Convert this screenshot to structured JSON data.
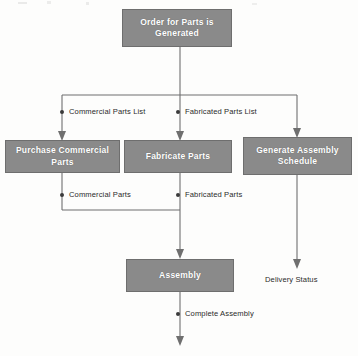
{
  "diagram": {
    "type": "flowchart",
    "box_fill_color": "#8a8a8a",
    "box_text_color": "#ffffff",
    "connector_color": "#6f6f6f",
    "background_color": "#fdfdfc",
    "nodes": [
      {
        "id": "order",
        "label": "Order for Parts is Generated",
        "x": 122,
        "y": 9,
        "w": 110,
        "h": 38
      },
      {
        "id": "purchase",
        "label": "Purchase Commercial Parts",
        "x": 5,
        "y": 140,
        "w": 115,
        "h": 33
      },
      {
        "id": "fabricate",
        "label": "Fabricate Parts",
        "x": 124,
        "y": 140,
        "w": 108,
        "h": 33
      },
      {
        "id": "schedule",
        "label": "Generate Assembly Schedule",
        "x": 243,
        "y": 137,
        "w": 109,
        "h": 38
      },
      {
        "id": "assembly",
        "label": "Assembly",
        "x": 126,
        "y": 259,
        "w": 108,
        "h": 33
      }
    ],
    "flow_labels": [
      {
        "id": "commercial-parts-list",
        "label": "Commercial Parts List",
        "dot_x": 62,
        "dot_y": 112,
        "text_x": 69,
        "text_y": 108
      },
      {
        "id": "fabricated-parts-list",
        "label": "Fabricated Parts List",
        "dot_x": 178,
        "dot_y": 112,
        "text_x": 185,
        "text_y": 108
      },
      {
        "id": "commercial-parts",
        "label": "Commercial Parts",
        "dot_x": 62,
        "dot_y": 195,
        "text_x": 69,
        "text_y": 191
      },
      {
        "id": "fabricated-parts",
        "label": "Fabricated Parts",
        "dot_x": 178,
        "dot_y": 195,
        "text_x": 185,
        "text_y": 191
      },
      {
        "id": "complete-assembly",
        "label": "Complete Assembly",
        "dot_x": 178,
        "dot_y": 314,
        "text_x": 185,
        "text_y": 310
      }
    ],
    "terminal_labels": [
      {
        "id": "delivery-status",
        "label": "Delivery Status",
        "x": 265,
        "y": 275
      }
    ]
  }
}
